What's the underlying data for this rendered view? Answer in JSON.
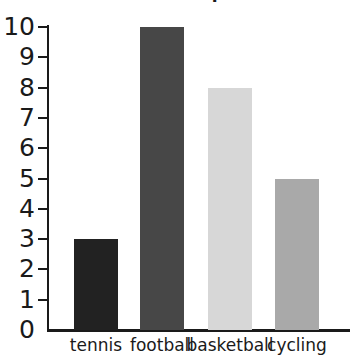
{
  "chart_data": {
    "type": "bar",
    "title": "Favourite sport",
    "categories": [
      "tennis",
      "football",
      "basketball",
      "cycling"
    ],
    "values": [
      3,
      10,
      8,
      5
    ],
    "xlabel": "",
    "ylabel": "",
    "ylim": [
      0,
      10
    ],
    "y_ticks": [
      0,
      1,
      2,
      3,
      4,
      5,
      6,
      7,
      8,
      9,
      10
    ],
    "y_tick_labels": [
      "0",
      "1",
      "2",
      "3",
      "4",
      "5",
      "6",
      "7",
      "8",
      "9",
      "10"
    ],
    "grid": false,
    "legend": "none",
    "bar_colors": [
      "#222222",
      "#474747",
      "#d7d7d7",
      "#a9a9a9"
    ],
    "axis_color": "#1a1a1a",
    "background": "#ffffff"
  },
  "axis": {
    "y_labels": [
      "10",
      "9",
      "8",
      "7",
      "6",
      "5",
      "4",
      "3",
      "2",
      "1",
      "0"
    ]
  },
  "bars": [
    {
      "label": "tennis",
      "value": 3,
      "color": "#222222"
    },
    {
      "label": "football",
      "value": 10,
      "color": "#474747"
    },
    {
      "label": "basketball",
      "value": 8,
      "color": "#d7d7d7"
    },
    {
      "label": "cycling",
      "value": 5,
      "color": "#a9a9a9"
    }
  ]
}
